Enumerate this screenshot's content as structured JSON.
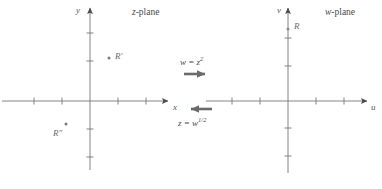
{
  "figure": {
    "type": "complex-plane-mapping-diagram",
    "background_color": "#ffffff",
    "axis_color": "#6e6e6e",
    "text_color": "#5a5a5a",
    "arrow_color": "#5a5a5a"
  },
  "z_plane": {
    "title": "z-plane",
    "title_italic_part": "z",
    "title_roman_part": "-plane",
    "x_axis_label": "x",
    "y_axis_label": "y",
    "points": [
      {
        "label": "R′",
        "name": "point-r-prime",
        "x": 109,
        "y": 58
      },
      {
        "label": "R″",
        "name": "point-r-double-prime",
        "x": 54,
        "y": 128
      }
    ],
    "origin": {
      "x": 90,
      "y": 101
    },
    "x_ticks": [
      -3,
      -2,
      2,
      3
    ],
    "y_ticks": [
      2,
      3,
      -2,
      -3
    ],
    "tick_spacing_px": 28
  },
  "w_plane": {
    "title": "w-plane",
    "title_italic_part": "w",
    "title_roman_part": "-plane",
    "u_axis_label": "u",
    "v_axis_label": "v",
    "points": [
      {
        "label": "R",
        "name": "point-r",
        "x": 289,
        "y": 29
      }
    ],
    "origin": {
      "x": 288,
      "y": 101
    },
    "u_ticks": [
      -3,
      -2,
      2,
      3
    ],
    "v_ticks": [
      2,
      3,
      -2,
      -3
    ],
    "tick_spacing_px": 28
  },
  "mapping": {
    "forward": {
      "label_base": "w = z",
      "label_exponent": "2",
      "full_label": "w = z²",
      "direction": "right",
      "arrow_name": "forward-mapping-arrow"
    },
    "inverse": {
      "label_base": "z = w",
      "label_exponent": "1/2",
      "full_label": "z = w^(1/2)",
      "direction": "left",
      "arrow_name": "inverse-mapping-arrow"
    }
  }
}
